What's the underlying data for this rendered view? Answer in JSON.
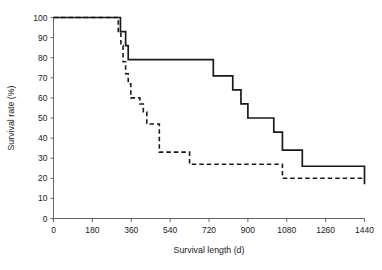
{
  "chart_data": {
    "type": "line",
    "title": "",
    "subtitle": "",
    "xlabel": "Survival length (d)",
    "ylabel": "Survival rate (%)",
    "xlim": [
      0,
      1440
    ],
    "ylim": [
      0,
      100
    ],
    "xticks": [
      0,
      180,
      360,
      540,
      720,
      900,
      1080,
      1260,
      1440
    ],
    "yticks": [
      0,
      10,
      20,
      30,
      40,
      50,
      60,
      70,
      80,
      90,
      100
    ],
    "grid": false,
    "legend": "none",
    "step_style": "post",
    "series": [
      {
        "name": "solid-curve",
        "style": "solid",
        "color": "#1a1a1a",
        "x": [
          0,
          300,
          310,
          322,
          334,
          346,
          712,
          740,
          790,
          830,
          868,
          900,
          1020,
          1060,
          1152,
          1440
        ],
        "y": [
          100,
          100,
          93,
          93,
          86,
          79,
          79,
          71,
          71,
          64,
          57,
          50,
          43,
          34,
          26,
          17
        ],
        "points": [
          {
            "x": 0,
            "y": 100
          },
          {
            "x": 300,
            "y": 100
          },
          {
            "x": 310,
            "y": 93
          },
          {
            "x": 322,
            "y": 93
          },
          {
            "x": 334,
            "y": 86
          },
          {
            "x": 346,
            "y": 79
          },
          {
            "x": 712,
            "y": 79
          },
          {
            "x": 740,
            "y": 71
          },
          {
            "x": 790,
            "y": 71
          },
          {
            "x": 830,
            "y": 64
          },
          {
            "x": 868,
            "y": 57
          },
          {
            "x": 900,
            "y": 50
          },
          {
            "x": 1020,
            "y": 43
          },
          {
            "x": 1060,
            "y": 34
          },
          {
            "x": 1152,
            "y": 26
          },
          {
            "x": 1440,
            "y": 17
          }
        ]
      },
      {
        "name": "dashed-curve",
        "style": "dashed",
        "color": "#1a1a1a",
        "x": [
          0,
          290,
          300,
          312,
          322,
          334,
          346,
          358,
          378,
          400,
          416,
          432,
          452,
          490,
          630,
          1060,
          1440
        ],
        "y": [
          100,
          100,
          93,
          86,
          78,
          72,
          67,
          60,
          60,
          57,
          53,
          47,
          47,
          33,
          27,
          20,
          20
        ],
        "points": [
          {
            "x": 0,
            "y": 100
          },
          {
            "x": 290,
            "y": 100
          },
          {
            "x": 300,
            "y": 93
          },
          {
            "x": 312,
            "y": 86
          },
          {
            "x": 322,
            "y": 78
          },
          {
            "x": 334,
            "y": 72
          },
          {
            "x": 346,
            "y": 67
          },
          {
            "x": 358,
            "y": 60
          },
          {
            "x": 378,
            "y": 60
          },
          {
            "x": 400,
            "y": 57
          },
          {
            "x": 416,
            "y": 53
          },
          {
            "x": 432,
            "y": 47
          },
          {
            "x": 452,
            "y": 47
          },
          {
            "x": 490,
            "y": 33
          },
          {
            "x": 630,
            "y": 27
          },
          {
            "x": 1060,
            "y": 20
          },
          {
            "x": 1440,
            "y": 20
          }
        ]
      }
    ]
  },
  "axes": {
    "x_title": "Survival length (d)",
    "y_title": "Survival rate (%)",
    "x_tick_labels": [
      "0",
      "180",
      "360",
      "540",
      "720",
      "900",
      "1080",
      "1260",
      "1440"
    ],
    "y_tick_labels": [
      "0",
      "10",
      "20",
      "30",
      "40",
      "50",
      "60",
      "70",
      "80",
      "90",
      "100"
    ]
  },
  "colors": {
    "axis": "#555555",
    "curve": "#1a1a1a",
    "text": "#1a1a1a",
    "background": "#ffffff"
  }
}
